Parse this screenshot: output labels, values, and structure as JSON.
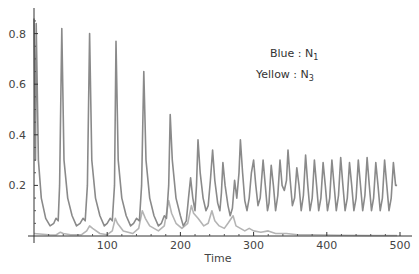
{
  "chart_data": {
    "type": "line",
    "title": "",
    "xlabel": "Time",
    "ylabel": "",
    "xlim": [
      0,
      500
    ],
    "ylim": [
      0,
      0.86
    ],
    "grid": false,
    "x_ticks": [
      100,
      200,
      300,
      400,
      500
    ],
    "x_tick_labels": [
      "100",
      "200",
      "300",
      "400",
      "500"
    ],
    "y_ticks": [
      0.2,
      0.4,
      0.6,
      0.8
    ],
    "y_tick_labels": [
      "0.2",
      "0.4",
      "0.6",
      "0.8"
    ],
    "legend": {
      "position": "upper-right",
      "entries": [
        {
          "label": "Blue : N",
          "sub": "1"
        },
        {
          "label": "Yellow : N",
          "sub": "3"
        }
      ]
    },
    "series": [
      {
        "name": "N1 (Blue)",
        "color": "#8a8a8a",
        "points": [
          [
            0,
            0.86
          ],
          [
            2,
            0.3
          ],
          [
            3,
            0.84
          ],
          [
            6,
            0.3
          ],
          [
            10,
            0.15
          ],
          [
            16,
            0.07
          ],
          [
            22,
            0.04
          ],
          [
            27,
            0.05
          ],
          [
            30,
            0.07
          ],
          [
            33,
            0.06
          ],
          [
            35,
            0.2
          ],
          [
            38,
            0.82
          ],
          [
            41,
            0.3
          ],
          [
            46,
            0.15
          ],
          [
            52,
            0.08
          ],
          [
            58,
            0.04
          ],
          [
            63,
            0.05
          ],
          [
            67,
            0.07
          ],
          [
            70,
            0.06
          ],
          [
            73,
            0.2
          ],
          [
            76,
            0.8
          ],
          [
            79,
            0.3
          ],
          [
            84,
            0.15
          ],
          [
            90,
            0.08
          ],
          [
            96,
            0.04
          ],
          [
            100,
            0.05
          ],
          [
            104,
            0.07
          ],
          [
            107,
            0.06
          ],
          [
            110,
            0.2
          ],
          [
            112,
            0.77
          ],
          [
            115,
            0.3
          ],
          [
            120,
            0.15
          ],
          [
            126,
            0.08
          ],
          [
            132,
            0.04
          ],
          [
            136,
            0.05
          ],
          [
            140,
            0.07
          ],
          [
            144,
            0.06
          ],
          [
            147,
            0.2
          ],
          [
            150,
            0.65
          ],
          [
            153,
            0.3
          ],
          [
            158,
            0.15
          ],
          [
            164,
            0.08
          ],
          [
            170,
            0.04
          ],
          [
            174,
            0.05
          ],
          [
            178,
            0.08
          ],
          [
            181,
            0.07
          ],
          [
            184,
            0.2
          ],
          [
            186,
            0.48
          ],
          [
            189,
            0.3
          ],
          [
            194,
            0.15
          ],
          [
            200,
            0.08
          ],
          [
            204,
            0.04
          ],
          [
            208,
            0.06
          ],
          [
            211,
            0.15
          ],
          [
            214,
            0.23
          ],
          [
            217,
            0.15
          ],
          [
            220,
            0.1
          ],
          [
            222,
            0.2
          ],
          [
            224,
            0.38
          ],
          [
            227,
            0.25
          ],
          [
            231,
            0.15
          ],
          [
            235,
            0.1
          ],
          [
            238,
            0.12
          ],
          [
            241,
            0.22
          ],
          [
            244,
            0.34
          ],
          [
            247,
            0.22
          ],
          [
            251,
            0.13
          ],
          [
            254,
            0.1
          ],
          [
            256,
            0.17
          ],
          [
            258,
            0.29
          ],
          [
            261,
            0.2
          ],
          [
            265,
            0.12
          ],
          [
            268,
            0.08
          ],
          [
            271,
            0.11
          ],
          [
            274,
            0.22
          ],
          [
            277,
            0.15
          ],
          [
            280,
            0.25
          ],
          [
            282,
            0.38
          ],
          [
            285,
            0.25
          ],
          [
            288,
            0.14
          ],
          [
            291,
            0.1
          ],
          [
            294,
            0.15
          ],
          [
            297,
            0.25
          ],
          [
            300,
            0.3
          ],
          [
            303,
            0.2
          ],
          [
            306,
            0.12
          ],
          [
            309,
            0.15
          ],
          [
            313,
            0.3
          ],
          [
            316,
            0.2
          ],
          [
            319,
            0.1
          ],
          [
            321,
            0.13
          ],
          [
            324,
            0.28
          ],
          [
            327,
            0.2
          ],
          [
            330,
            0.1
          ],
          [
            333,
            0.16
          ],
          [
            336,
            0.3
          ],
          [
            339,
            0.2
          ],
          [
            342,
            0.18
          ],
          [
            345,
            0.22
          ],
          [
            347,
            0.34
          ],
          [
            350,
            0.22
          ],
          [
            353,
            0.12
          ],
          [
            356,
            0.15
          ],
          [
            359,
            0.27
          ],
          [
            362,
            0.2
          ],
          [
            365,
            0.1
          ],
          [
            368,
            0.16
          ],
          [
            371,
            0.32
          ],
          [
            374,
            0.2
          ],
          [
            377,
            0.1
          ],
          [
            380,
            0.15
          ],
          [
            383,
            0.3
          ],
          [
            386,
            0.2
          ],
          [
            389,
            0.1
          ],
          [
            392,
            0.15
          ],
          [
            395,
            0.29
          ],
          [
            398,
            0.2
          ],
          [
            401,
            0.1
          ],
          [
            404,
            0.15
          ],
          [
            407,
            0.3
          ],
          [
            410,
            0.2
          ],
          [
            413,
            0.1
          ],
          [
            416,
            0.16
          ],
          [
            419,
            0.31
          ],
          [
            422,
            0.2
          ],
          [
            425,
            0.1
          ],
          [
            428,
            0.15
          ],
          [
            431,
            0.29
          ],
          [
            434,
            0.2
          ],
          [
            437,
            0.1
          ],
          [
            440,
            0.15
          ],
          [
            443,
            0.3
          ],
          [
            446,
            0.2
          ],
          [
            449,
            0.1
          ],
          [
            452,
            0.16
          ],
          [
            455,
            0.31
          ],
          [
            458,
            0.2
          ],
          [
            461,
            0.1
          ],
          [
            464,
            0.15
          ],
          [
            467,
            0.29
          ],
          [
            470,
            0.2
          ],
          [
            473,
            0.1
          ],
          [
            476,
            0.15
          ],
          [
            479,
            0.3
          ],
          [
            482,
            0.2
          ],
          [
            485,
            0.1
          ],
          [
            488,
            0.15
          ],
          [
            491,
            0.29
          ],
          [
            494,
            0.2
          ],
          [
            496,
            0.2
          ]
        ]
      },
      {
        "name": "N3 (Yellow)",
        "color": "#b4b4b4",
        "points": [
          [
            0,
            0.01
          ],
          [
            20,
            0.005
          ],
          [
            30,
            0.004
          ],
          [
            36,
            0.015
          ],
          [
            40,
            0.01
          ],
          [
            50,
            0.005
          ],
          [
            65,
            0.005
          ],
          [
            72,
            0.02
          ],
          [
            76,
            0.04
          ],
          [
            80,
            0.03
          ],
          [
            90,
            0.01
          ],
          [
            100,
            0.005
          ],
          [
            107,
            0.02
          ],
          [
            111,
            0.07
          ],
          [
            114,
            0.05
          ],
          [
            122,
            0.02
          ],
          [
            135,
            0.01
          ],
          [
            143,
            0.03
          ],
          [
            148,
            0.1
          ],
          [
            152,
            0.07
          ],
          [
            158,
            0.04
          ],
          [
            170,
            0.02
          ],
          [
            178,
            0.04
          ],
          [
            184,
            0.14
          ],
          [
            188,
            0.09
          ],
          [
            194,
            0.05
          ],
          [
            202,
            0.03
          ],
          [
            210,
            0.05
          ],
          [
            215,
            0.12
          ],
          [
            218,
            0.09
          ],
          [
            224,
            0.07
          ],
          [
            232,
            0.04
          ],
          [
            238,
            0.05
          ],
          [
            243,
            0.1
          ],
          [
            247,
            0.06
          ],
          [
            253,
            0.04
          ],
          [
            260,
            0.03
          ],
          [
            265,
            0.05
          ],
          [
            272,
            0.08
          ],
          [
            276,
            0.04
          ],
          [
            282,
            0.03
          ],
          [
            288,
            0.02
          ],
          [
            294,
            0.03
          ],
          [
            300,
            0.02
          ],
          [
            310,
            0.015
          ],
          [
            320,
            0.02
          ],
          [
            330,
            0.01
          ],
          [
            345,
            0.01
          ],
          [
            360,
            0.005
          ],
          [
            380,
            0.005
          ],
          [
            420,
            0.003
          ],
          [
            460,
            0.002
          ],
          [
            496,
            0.002
          ]
        ]
      }
    ]
  }
}
